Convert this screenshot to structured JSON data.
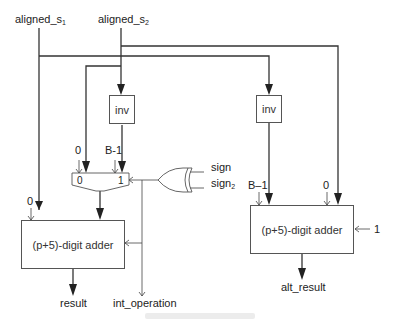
{
  "inputs": {
    "s1": {
      "base": "aligned_s",
      "sub": "1"
    },
    "s2": {
      "base": "aligned_s",
      "sub": "2"
    }
  },
  "blocks": {
    "inv_left": "inv",
    "inv_right": "inv",
    "adder_left": "(p+5)-digit adder",
    "adder_right": "(p+5)-digit adder"
  },
  "mux": {
    "in0": "0",
    "in1": "1"
  },
  "constants": {
    "mux_zero": "0",
    "mux_bm1": "B-1",
    "adder_left_zero": "0",
    "adder_right_bm1": "B–1",
    "adder_right_zero": "0",
    "adder_right_carry": "1"
  },
  "xor": {
    "in1": "sign",
    "in2_base": "sign",
    "in2_sub": "2"
  },
  "outputs": {
    "result": "result",
    "int_operation": "int_operation",
    "alt_result": "alt_result"
  },
  "colors": {
    "line": "#333333",
    "box_border": "#555555",
    "background": "#ffffff"
  }
}
